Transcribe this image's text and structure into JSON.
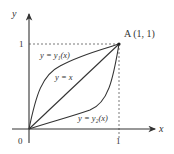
{
  "diagram": {
    "axes": {
      "x_label": "x",
      "y_label": "y",
      "origin_label": "0",
      "x_tick_label": "1",
      "y_tick_label": "1"
    },
    "point": {
      "label": "A (1, 1)",
      "x": 1,
      "y": 1
    },
    "curves": [
      {
        "name": "upper",
        "label": "y = y₁(x)"
      },
      {
        "name": "diagonal",
        "label": "y = x"
      },
      {
        "name": "lower",
        "label": "y = y₂(x)"
      }
    ],
    "colors": {
      "stroke": "#333333",
      "dashed": "#555555"
    }
  }
}
